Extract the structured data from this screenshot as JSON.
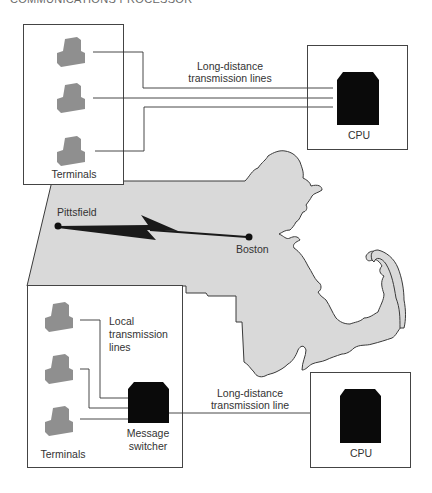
{
  "header": {
    "title": "COMMUNICATIONS PROCESSOR"
  },
  "colors": {
    "map_fill": "#d9d9d9",
    "map_stroke": "#3a3a3a",
    "terminal_fill": "#8f8f8f",
    "cpu_fill": "#0a0a0a",
    "box_stroke": "#444444",
    "line_stroke": "#333333"
  },
  "top_panel": {
    "terminals_box": {
      "label": "Terminals",
      "terminal_count": 3
    },
    "link_label_line1": "Long-distance",
    "link_label_line2": "transmission lines",
    "cpu_box": {
      "label": "CPU"
    }
  },
  "map": {
    "region": "Massachusetts",
    "cities": [
      {
        "name": "Pittsfield"
      },
      {
        "name": "Boston"
      }
    ],
    "link_icon": "lightning-bolt-icon"
  },
  "bottom_panel": {
    "terminals_box": {
      "label": "Terminals",
      "terminal_count": 3,
      "local_label_line1": "Local",
      "local_label_line2": "transmission",
      "local_label_line3": "lines",
      "switcher_label_line1": "Message",
      "switcher_label_line2": "switcher"
    },
    "link_label_line1": "Long-distance",
    "link_label_line2": "transmission line",
    "cpu_box": {
      "label": "CPU"
    }
  }
}
